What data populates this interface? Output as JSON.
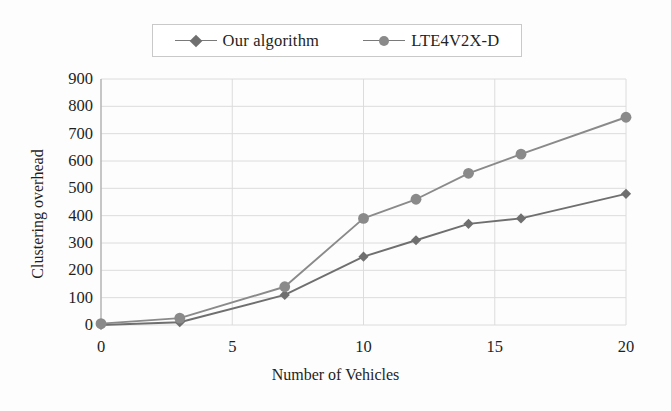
{
  "chart_data": {
    "type": "line",
    "title": "",
    "xlabel": "Number of Vehicles",
    "ylabel": "Clustering  overhead",
    "x": [
      0,
      3,
      7,
      10,
      12,
      14,
      16,
      20
    ],
    "xlim": [
      0,
      20
    ],
    "ylim": [
      0,
      900
    ],
    "xticks": [
      0,
      5,
      10,
      15,
      20
    ],
    "yticks": [
      0,
      100,
      200,
      300,
      400,
      500,
      600,
      700,
      800,
      900
    ],
    "grid": true,
    "legend_position": "top-center",
    "series": [
      {
        "name": "Our algorithm",
        "marker": "diamond",
        "color": "#6f6f6f",
        "values": [
          0,
          10,
          110,
          250,
          310,
          370,
          390,
          480
        ]
      },
      {
        "name": "LTE4V2X-D",
        "marker": "circle",
        "color": "#8a8a8a",
        "values": [
          5,
          25,
          140,
          390,
          460,
          555,
          625,
          760
        ]
      }
    ]
  },
  "axes": {
    "xtick_labels": [
      "0",
      "5",
      "10",
      "15",
      "20"
    ],
    "ytick_labels": [
      "0",
      "100",
      "200",
      "300",
      "400",
      "500",
      "600",
      "700",
      "800",
      "900"
    ],
    "xlabel_text": "Number of Vehicles",
    "ylabel_text": "Clustering  overhead"
  },
  "legend": {
    "entries": [
      {
        "label": "Our algorithm",
        "marker": "diamond-icon"
      },
      {
        "label": "LTE4V2X-D",
        "marker": "circle-icon"
      }
    ]
  },
  "colors": {
    "series_1": "#6f6f6f",
    "series_2": "#8a8a8a",
    "gridline": "#dcdcdc",
    "axis": "#b8b8b8",
    "text": "#1f1f1f",
    "background": "#fdfdfd"
  }
}
